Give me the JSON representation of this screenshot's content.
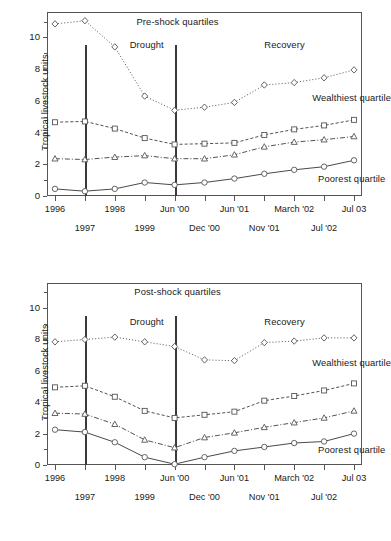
{
  "chart_data": [
    {
      "type": "line",
      "title": "Pre-shock quartiles",
      "xlabel": "",
      "ylabel": "Tropical livestock units",
      "ylim": [
        0,
        11.6
      ],
      "yticks": [
        0,
        2,
        4,
        6,
        8,
        10
      ],
      "grid": false,
      "legend": "inline-annotations",
      "x": [
        "1996",
        "1997",
        "1998",
        "1999",
        "Jun '00",
        "Dec '00",
        "Jun '01",
        "Nov '01",
        "March '02",
        "Jul '02",
        "Jul 03"
      ],
      "categories": [
        "1996",
        "1997",
        "1998",
        "1999",
        "Jun '00",
        "Dec '00",
        "Jun '01",
        "Nov '01",
        "March '02",
        "Jul '02",
        "Jul 03"
      ],
      "annotations": [
        {
          "text": "Pre-shock quartiles",
          "x_index": 4.1,
          "y": 11.0
        },
        {
          "text": "Drought",
          "x_index": 2.5,
          "y": 9.5
        },
        {
          "text": "Recovery",
          "x_index": 7.0,
          "y": 9.5
        },
        {
          "text": "Wealthiest quartile",
          "x_index": 8.6,
          "y": 6.2
        },
        {
          "text": "Poorest quartile",
          "x_index": 8.8,
          "y": 1.1
        }
      ],
      "series": [
        {
          "name": "Wealthiest quartile",
          "marker": "diamond",
          "line": "dotted",
          "values": [
            10.85,
            11.05,
            9.4,
            6.3,
            5.4,
            5.6,
            5.9,
            7.0,
            7.15,
            7.45,
            7.95
          ]
        },
        {
          "name": "Third quartile",
          "marker": "square",
          "line": "dashed",
          "values": [
            4.65,
            4.7,
            4.25,
            3.65,
            3.25,
            3.3,
            3.35,
            3.85,
            4.2,
            4.45,
            4.8
          ]
        },
        {
          "name": "Second quartile",
          "marker": "triangle",
          "line": "dashdot",
          "values": [
            2.35,
            2.3,
            2.45,
            2.55,
            2.35,
            2.35,
            2.6,
            3.1,
            3.4,
            3.55,
            3.75
          ]
        },
        {
          "name": "Poorest quartile",
          "marker": "circle",
          "line": "solid",
          "values": [
            0.45,
            0.3,
            0.45,
            0.85,
            0.7,
            0.85,
            1.1,
            1.4,
            1.65,
            1.85,
            2.25
          ]
        }
      ],
      "vlines": [
        {
          "x_index": 1,
          "label": "drought-start"
        },
        {
          "x_index": 4,
          "label": "drought-end"
        }
      ]
    },
    {
      "type": "line",
      "title": "Post-shock quartiles",
      "xlabel": "",
      "ylabel": "Tropical livestock units",
      "ylim": [
        0,
        11.6
      ],
      "yticks": [
        0,
        2,
        4,
        6,
        8,
        10
      ],
      "grid": false,
      "legend": "inline-annotations",
      "x": [
        "1996",
        "1997",
        "1998",
        "1999",
        "Jun '00",
        "Dec '00",
        "Jun '01",
        "Nov '01",
        "March '02",
        "Jul '02",
        "Jul 03"
      ],
      "categories": [
        "1996",
        "1997",
        "1998",
        "1999",
        "Jun '00",
        "Dec '00",
        "Jun '01",
        "Nov '01",
        "March '02",
        "Jul '02",
        "Jul 03"
      ],
      "annotations": [
        {
          "text": "Post-shock quartiles",
          "x_index": 4.1,
          "y": 11.0
        },
        {
          "text": "Drought",
          "x_index": 2.5,
          "y": 9.1
        },
        {
          "text": "Recovery",
          "x_index": 7.0,
          "y": 9.1
        },
        {
          "text": "Wealthiest quartile",
          "x_index": 8.6,
          "y": 6.5
        },
        {
          "text": "Poorest quartile",
          "x_index": 8.8,
          "y": 0.95
        }
      ],
      "series": [
        {
          "name": "Wealthiest quartile",
          "marker": "diamond",
          "line": "dotted",
          "values": [
            7.85,
            8.0,
            8.15,
            7.85,
            7.55,
            6.7,
            6.65,
            7.8,
            7.9,
            8.1,
            8.1
          ]
        },
        {
          "name": "Third quartile",
          "marker": "square",
          "line": "dashed",
          "values": [
            4.95,
            5.05,
            4.35,
            3.45,
            3.0,
            3.2,
            3.4,
            4.1,
            4.4,
            4.75,
            5.2
          ]
        },
        {
          "name": "Second quartile",
          "marker": "triangle",
          "line": "dashdot",
          "values": [
            3.3,
            3.25,
            2.6,
            1.6,
            1.1,
            1.75,
            2.05,
            2.4,
            2.7,
            3.0,
            3.45
          ]
        },
        {
          "name": "Poorest quartile",
          "marker": "circle",
          "line": "solid",
          "values": [
            2.25,
            2.1,
            1.45,
            0.5,
            0.05,
            0.5,
            0.9,
            1.15,
            1.4,
            1.5,
            2.0
          ]
        }
      ],
      "vlines": [
        {
          "x_index": 1,
          "label": "drought-start"
        },
        {
          "x_index": 4,
          "label": "drought-end"
        }
      ]
    }
  ],
  "axis_labels": {
    "y_title": "Tropical livestock units",
    "row_top": [
      "1996",
      "",
      "1998",
      "",
      "Jun '00",
      "",
      "Jun '01",
      "",
      "March '02",
      "",
      "Jul 03"
    ],
    "row_bottom": [
      "",
      "1997",
      "",
      "1999",
      "",
      "Dec '00",
      "",
      "Nov '01",
      "",
      "Jul '02",
      ""
    ]
  },
  "colors": {
    "axis": "#555555",
    "series_line": "#4a4a4a",
    "vline": "#3a3a3a",
    "text": "#1a1a1a",
    "background": "#ffffff"
  }
}
